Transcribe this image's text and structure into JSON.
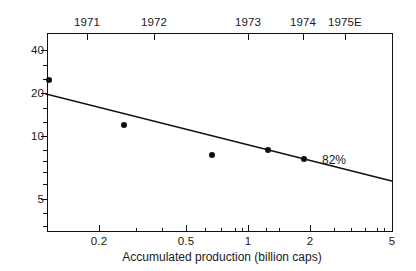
{
  "chart_data": {
    "type": "scatter",
    "title": "",
    "subtitle": "",
    "xlabel": "Accumulated production (billion caps)",
    "ylabel": "",
    "xscale": "log",
    "yscale": "log",
    "xlim": [
      0.13,
      8.0
    ],
    "ylim": [
      3.6,
      48
    ],
    "grid": false,
    "legend": null,
    "x_tick_labels": [
      "0.2",
      "0.5",
      "1",
      "2",
      "5"
    ],
    "x_tick_values": [
      0.2,
      0.5,
      1,
      2,
      5
    ],
    "x_minor_tick_values": [
      0.3,
      0.4,
      0.6,
      0.7,
      0.8,
      0.9,
      3,
      4,
      6,
      7
    ],
    "y_tick_labels": [
      "40",
      "20",
      "10",
      "5"
    ],
    "y_tick_values": [
      40,
      20,
      10,
      5
    ],
    "y_minor_tick_values": [
      30,
      15,
      9,
      8,
      7,
      6,
      4
    ],
    "secondary_axis": {
      "position": "top",
      "labels": [
        "1971",
        "1972",
        "1973",
        "1974",
        "1975E"
      ],
      "x_values": [
        0.17,
        0.35,
        0.95,
        1.75,
        2.6
      ]
    },
    "series": [
      {
        "name": "Observed price",
        "type": "scatter",
        "points": [
          {
            "x": 0.155,
            "y": 24.5,
            "year": "1971"
          },
          {
            "x": 0.345,
            "y": 14.0,
            "year": "1972"
          },
          {
            "x": 0.98,
            "y": 8.6,
            "year": "1973"
          },
          {
            "x": 1.85,
            "y": 9.2,
            "year": "1974"
          },
          {
            "x": 2.7,
            "y": 8.0,
            "year": "1975E"
          }
        ]
      },
      {
        "name": "82% experience curve",
        "type": "line",
        "annotation": "82%",
        "endpoints": [
          {
            "x": 0.133,
            "y": 20.0
          },
          {
            "x": 7.8,
            "y": 5.5
          }
        ]
      }
    ],
    "annotations": [
      {
        "text": "82%",
        "x": 3.6,
        "y": 7.2
      }
    ]
  },
  "axes": {
    "bottom_title": "Accumulated production (billion caps)",
    "top_ticks": [
      {
        "label": "1971",
        "px": 87
      },
      {
        "label": "1972",
        "px": 154
      },
      {
        "label": "1973",
        "px": 248
      },
      {
        "label": "1974",
        "px": 303
      },
      {
        "label": "1975E",
        "px": 345
      }
    ],
    "bottom_ticks": [
      {
        "label": "0.2",
        "px": 99
      },
      {
        "label": "0.5",
        "px": 186
      },
      {
        "label": "1",
        "px": 248
      },
      {
        "label": "2",
        "px": 310
      },
      {
        "label": "5",
        "px": 392
      }
    ],
    "bottom_minor_ticks": [
      136,
      162,
      205,
      221,
      235,
      242,
      266,
      279,
      334,
      351,
      365,
      377,
      384
    ],
    "left_ticks": [
      {
        "label": "40",
        "px": 50
      },
      {
        "label": "20",
        "px": 93
      },
      {
        "label": "10",
        "px": 136
      },
      {
        "label": "5",
        "px": 199
      }
    ],
    "left_minor_ticks": [
      65,
      79,
      108,
      122,
      150,
      161,
      172,
      184,
      213,
      226
    ]
  },
  "markers": [
    {
      "name": "1971",
      "px": 49,
      "py": 80
    },
    {
      "name": "1972",
      "px": 124,
      "py": 125
    },
    {
      "name": "1973",
      "px": 212,
      "py": 155
    },
    {
      "name": "1974",
      "px": 268,
      "py": 150
    },
    {
      "name": "1975E",
      "px": 304,
      "py": 159
    }
  ],
  "fit_line": {
    "label": "82%",
    "x1": 46,
    "y1": 94,
    "x2": 392,
    "y2": 181
  },
  "colors": {
    "ink": "#111111",
    "background": "#ffffff",
    "marker": "#0d0d0d"
  }
}
